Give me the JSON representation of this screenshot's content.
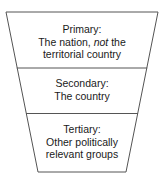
{
  "diagram": {
    "type": "funnel",
    "stroke_color": "#555555",
    "text_color": "#1a1a1a",
    "background": "#ffffff",
    "sections": [
      {
        "level": "Primary",
        "title": "Primary:",
        "line2_prefix": "The nation, ",
        "line2_emphasis": "not",
        "line2_suffix": " the",
        "line3": "territorial country"
      },
      {
        "level": "Secondary",
        "title": "Secondary:",
        "line2": "The country"
      },
      {
        "level": "Tertiary",
        "title": "Tertiary:",
        "line2": "Other politically",
        "line3": "relevant groups"
      }
    ]
  }
}
